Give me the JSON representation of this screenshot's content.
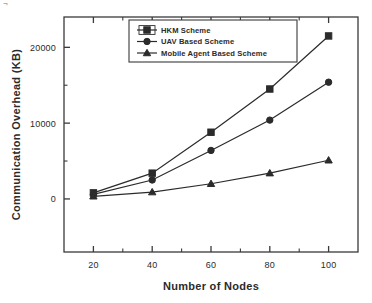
{
  "figure": {
    "background_color": "#ffffff",
    "axis_color": "#3a3a3a",
    "series_color": "#2b2b2b"
  },
  "chart_data": {
    "type": "line",
    "title": "",
    "subtitle": "",
    "xlabel": "Number of Nodes",
    "ylabel": "Communication Overhead (KB)",
    "x": [
      20,
      40,
      60,
      80,
      100
    ],
    "xtick_labels": [
      "20",
      "40",
      "60",
      "80",
      "100"
    ],
    "ytick_labels": [
      "0",
      "10000",
      "20000"
    ],
    "yticks": [
      0,
      10000,
      20000
    ],
    "yminor_ticks": [
      5000,
      15000
    ],
    "xlim": [
      10,
      110
    ],
    "ylim": [
      -7000,
      24000
    ],
    "grid": false,
    "legend_position": "top-center",
    "series": [
      {
        "name": "HKM  Scheme",
        "marker": "square",
        "values": [
          800,
          3400,
          8800,
          14500,
          21500
        ]
      },
      {
        "name": "UAV Based Scheme",
        "marker": "circle",
        "values": [
          600,
          2500,
          6400,
          10400,
          15400
        ]
      },
      {
        "name": "Mobile Agent Based Scheme",
        "marker": "triangle",
        "values": [
          350,
          900,
          2000,
          3400,
          5100
        ]
      }
    ]
  },
  "artifacts": {
    "corner_glyph": "¬"
  }
}
